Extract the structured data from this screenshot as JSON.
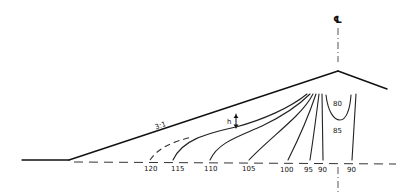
{
  "diagram": {
    "centerline_symbol": "℄",
    "slope_label": "3:1",
    "dimension_label": "h",
    "contours": [
      {
        "id": "c120",
        "label": "120",
        "style": "dashed"
      },
      {
        "id": "c115",
        "label": "115",
        "style": "solid"
      },
      {
        "id": "c110",
        "label": "110",
        "style": "solid"
      },
      {
        "id": "c105",
        "label": "105",
        "style": "solid"
      },
      {
        "id": "c100",
        "label": "100",
        "style": "solid"
      },
      {
        "id": "c95",
        "label": "95",
        "style": "solid"
      },
      {
        "id": "c90a",
        "label": "90",
        "style": "solid"
      },
      {
        "id": "c90b",
        "label": "90",
        "style": "solid"
      },
      {
        "id": "c80",
        "label": "80",
        "style": "solid"
      },
      {
        "id": "c85",
        "label": "85",
        "style": "region"
      }
    ]
  }
}
